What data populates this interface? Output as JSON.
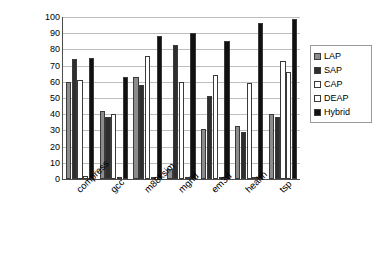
{
  "chart_data": {
    "type": "bar",
    "title": "",
    "subtitle": "",
    "xlabel": "",
    "ylabel": "% Dynamic Loads Covered",
    "ylim": [
      0,
      100
    ],
    "ytick_step": 10,
    "yticks": [
      0,
      10,
      20,
      30,
      40,
      50,
      60,
      70,
      80,
      90,
      100
    ],
    "ytick_labels": [
      "0",
      "10",
      "20",
      "30",
      "40",
      "50",
      "60",
      "70",
      "80",
      "90",
      "100"
    ],
    "grid": true,
    "grid_axis": "y",
    "legend_position": "right",
    "categories": [
      "compress",
      "gcc",
      "m88ksim",
      "mgrid",
      "em3d",
      "health",
      "tsp"
    ],
    "series": [
      {
        "name": "LAP",
        "color": "#8c8c8c",
        "values": [
          60,
          42,
          63,
          6,
          31,
          33,
          40
        ]
      },
      {
        "name": "SAP",
        "color": "#2e2e2e",
        "values": [
          74,
          38,
          58,
          83,
          51,
          29,
          38
        ]
      },
      {
        "name": "CAP",
        "color": "#ffffff",
        "values": [
          61,
          40,
          76,
          60,
          64,
          59,
          73
        ]
      },
      {
        "name": "DEAP",
        "color": "#ffffff",
        "values": [
          2,
          1,
          1,
          1,
          1,
          1,
          66
        ]
      },
      {
        "name": "Hybrid",
        "color": "#111111",
        "values": [
          75,
          63,
          88,
          90,
          85,
          96,
          99
        ]
      }
    ]
  },
  "legend": {
    "items": [
      {
        "label": "LAP"
      },
      {
        "label": "SAP"
      },
      {
        "label": "CAP"
      },
      {
        "label": "DEAP"
      },
      {
        "label": "Hybrid"
      }
    ]
  }
}
